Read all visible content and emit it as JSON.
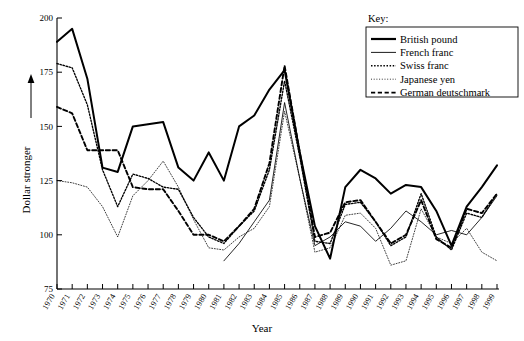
{
  "chart_data": {
    "type": "line",
    "title": "",
    "xlabel": "Year",
    "ylabel": "Dollar stronger",
    "ylim": [
      75,
      200
    ],
    "yticks": [
      75,
      100,
      125,
      150,
      175,
      200
    ],
    "grid": false,
    "legend_position": "top-right",
    "legend_title": "Key:",
    "x": [
      1970,
      1971,
      1972,
      1973,
      1974,
      1975,
      1976,
      1977,
      1978,
      1979,
      1980,
      1981,
      1982,
      1983,
      1984,
      1985,
      1986,
      1987,
      1988,
      1989,
      1990,
      1991,
      1992,
      1993,
      1994,
      1995,
      1996,
      1997,
      1998,
      1999
    ],
    "xtick_labels": [
      "1970",
      "1971",
      "1972",
      "1973",
      "1974",
      "1975",
      "1976",
      "1977",
      "1978",
      "1979",
      "1980",
      "1981",
      "1982",
      "1983",
      "1984",
      "1985",
      "1986",
      "1987",
      "1988",
      "1989",
      "1990",
      "1991",
      "1992",
      "1993",
      "1994",
      "1995",
      "1996",
      "1997",
      "1998",
      "1999"
    ],
    "series": [
      {
        "name": "British pound",
        "line_style": "solid-thick",
        "values": [
          189,
          195,
          172,
          131,
          129,
          150,
          151,
          152,
          131,
          125,
          138,
          125,
          150,
          155,
          167,
          176,
          138,
          104,
          89,
          122,
          130,
          126,
          119,
          123,
          122,
          111,
          95,
          113,
          122,
          132
        ]
      },
      {
        "name": "French franc",
        "line_style": "solid-thin",
        "values": [
          null,
          null,
          null,
          null,
          null,
          null,
          null,
          null,
          null,
          null,
          null,
          88,
          96,
          106,
          116,
          161,
          126,
          95,
          99,
          106,
          104,
          97,
          103,
          111,
          106,
          100,
          102,
          100,
          108,
          118
        ]
      },
      {
        "name": "Swiss franc",
        "line_style": "dotted-medium",
        "values": [
          179,
          177,
          160,
          130,
          113,
          128,
          126,
          122,
          121,
          108,
          99,
          96,
          104,
          111,
          130,
          171,
          136,
          97,
          96,
          114,
          115,
          106,
          95,
          99,
          119,
          99,
          93,
          110,
          108,
          119
        ]
      },
      {
        "name": "Japanese yen",
        "line_style": "dotted-fine",
        "values": [
          125,
          124,
          122,
          113,
          99,
          118,
          125,
          134,
          122,
          107,
          94,
          93,
          99,
          103,
          113,
          157,
          126,
          92,
          94,
          109,
          110,
          103,
          86,
          88,
          112,
          99,
          96,
          103,
          92,
          88
        ]
      },
      {
        "name": "German deutschmark",
        "line_style": "dashed",
        "values": [
          159,
          156,
          139,
          139,
          139,
          122,
          121,
          121,
          111,
          100,
          100,
          97,
          104,
          112,
          133,
          178,
          138,
          99,
          101,
          115,
          116,
          106,
          96,
          100,
          116,
          98,
          94,
          112,
          110,
          119
        ]
      }
    ]
  },
  "legend": {
    "title": "Key:",
    "items": [
      {
        "label": "British pound",
        "style": "solid-thick"
      },
      {
        "label": "French franc",
        "style": "solid-thin"
      },
      {
        "label": "Swiss franc",
        "style": "dotted-medium"
      },
      {
        "label": "Japanese yen",
        "style": "dotted-fine"
      },
      {
        "label": "German deutschmark",
        "style": "dashed"
      }
    ]
  }
}
